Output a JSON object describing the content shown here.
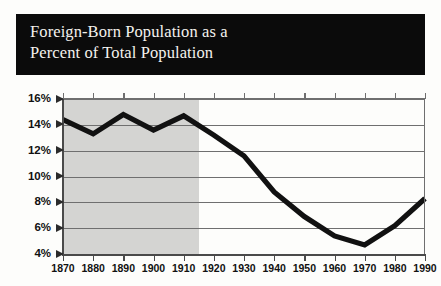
{
  "banner": {
    "title": "Foreign-Born Population as a\nPercent of Total Population"
  },
  "colors": {
    "banner_background": "#0b0b0b",
    "banner_text": "#f4f2ee",
    "page_background": "#fdfdfb",
    "line": "#111111",
    "gridline": "#6f6f6f",
    "shaded_band": "#d4d4d2",
    "axis": "#4a4a4a"
  },
  "chart_data": {
    "type": "line",
    "title": "Foreign-Born Population as a Percent of Total Population",
    "xlabel": "",
    "ylabel": "",
    "x": [
      1870,
      1880,
      1890,
      1900,
      1910,
      1920,
      1930,
      1940,
      1950,
      1960,
      1970,
      1980,
      1990
    ],
    "categories": [
      "1870",
      "1880",
      "1890",
      "1900",
      "1910",
      "1920",
      "1930",
      "1940",
      "1950",
      "1960",
      "1970",
      "1980",
      "1990"
    ],
    "values": [
      14.4,
      13.3,
      14.8,
      13.6,
      14.7,
      13.2,
      11.6,
      8.8,
      6.9,
      5.4,
      4.7,
      6.2,
      8.3
    ],
    "series": [
      {
        "name": "Foreign-Born Percent of Total Population",
        "values": [
          14.4,
          13.3,
          14.8,
          13.6,
          14.7,
          13.2,
          11.6,
          8.8,
          6.9,
          5.4,
          4.7,
          6.2,
          8.3
        ]
      }
    ],
    "ylim": [
      4,
      16
    ],
    "xlim": [
      1870,
      1990
    ],
    "ytick_labels": [
      "16%",
      "14%",
      "12%",
      "10%",
      "8%",
      "6%",
      "4%"
    ],
    "ytick_values": [
      16,
      14,
      12,
      10,
      8,
      6,
      4
    ],
    "xtick_labels": [
      "1870",
      "1880",
      "1890",
      "1900",
      "1910",
      "1920",
      "1930",
      "1940",
      "1950",
      "1960",
      "1970",
      "1980",
      "1990"
    ],
    "grid": true,
    "legend": "none",
    "annotations": [
      {
        "type": "shaded-band",
        "x_start": 1870,
        "x_end": 1915,
        "label": ""
      }
    ]
  }
}
